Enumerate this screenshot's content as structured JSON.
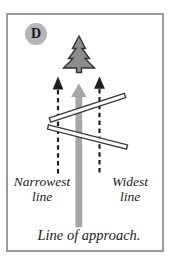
{
  "panel": {
    "label": "D",
    "annotations": {
      "narrowest": "Narrowest\nline",
      "widest": "Widest\nline",
      "approach": "Line of approach."
    },
    "icons": {
      "tree": "fir-tree-icon",
      "center_arrow": "thick-gray-up-arrow",
      "side_arrows": "dashed-black-up-arrows",
      "crossing_lines": "double-stroke-diagonal-lines"
    },
    "colors": {
      "border_gray": "#9b9b9b",
      "badge_fill": "#b5b5b5",
      "tree_fill": "#8c8c8c",
      "tree_outline": "#333333",
      "approach_arrow_gray": "#a6a6a6",
      "dashed_arrow_black": "#1f1f1f",
      "crossing_line_dark": "#3a3a3a",
      "text_color": "#1b1b22",
      "background": "#ffffff"
    }
  }
}
